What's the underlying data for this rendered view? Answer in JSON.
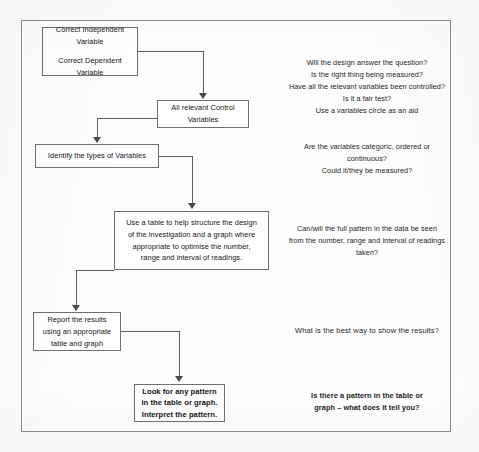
{
  "diagram": {
    "nodes": [
      {
        "id": "variables",
        "line1": "Correct Independent",
        "line2": "Variable",
        "line3": "Correct Dependent",
        "line4": "Variable"
      },
      {
        "id": "control-variables",
        "line1": "All relevant Control",
        "line2": "Variables"
      },
      {
        "id": "identify-types",
        "line1": "Identify the types of Variables"
      },
      {
        "id": "table-design",
        "line1": "Use a table to help structure the design",
        "line2": "of the investigation and a graph where",
        "line3": "appropriate to optimise the number,",
        "line4": "range and interval of readings."
      },
      {
        "id": "report-results",
        "line1": "Report the results",
        "line2": "using an appropriate",
        "line3": "table and graph"
      },
      {
        "id": "look-for-pattern",
        "line1": "Look for any pattern",
        "line2": "in the table or graph.",
        "line3": "Interpret the pattern."
      }
    ],
    "notes": [
      {
        "id": "note-design",
        "line1": "Will the design answer the question?",
        "line2": "Is the right thing being measured?",
        "line3": "Have all the relevant variables been controlled?",
        "line4": "Is it a fair test?",
        "line5": "Use a variables circle as an aid"
      },
      {
        "id": "note-variable-types",
        "line1": "Are the variables categoric, ordered or",
        "line2": "continuous?",
        "line3": "Could it/they be measured?"
      },
      {
        "id": "note-pattern-visible",
        "line1": "Can/will the full pattern in the data be seen",
        "line2": "from the number, range and interval of readings",
        "line3": "taken?"
      },
      {
        "id": "note-show-results",
        "line1": "What  is the best way to show  the results?"
      },
      {
        "id": "note-pattern-meaning",
        "line1": "Is there a pattern in the table or",
        "line2": "graph – what does  it tell you?"
      }
    ]
  },
  "colors": {
    "border": "#6f6f6f",
    "frame": "#8d8d8d",
    "connector": "#5f5f5f",
    "text": "#141414",
    "page": "#fdfdfd"
  }
}
